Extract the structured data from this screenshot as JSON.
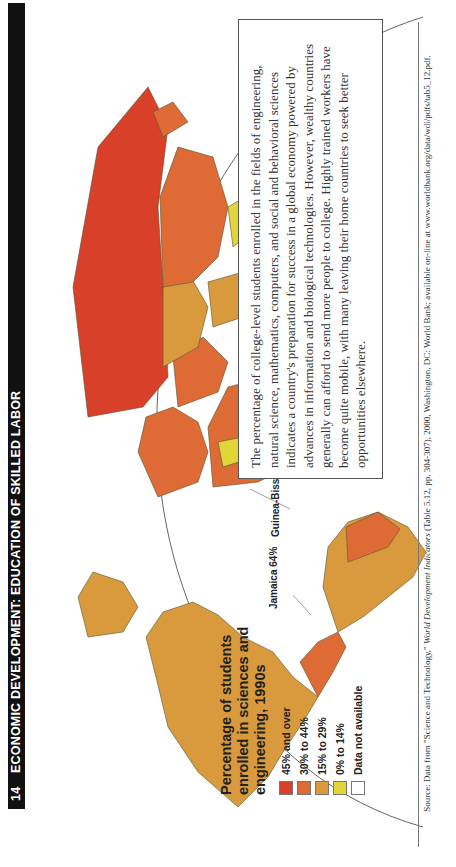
{
  "header": {
    "page_number": "14",
    "title": "ECONOMIC DEVELOPMENT: EDUCATION OF SKILLED LABOR"
  },
  "legend": {
    "title": "Percentage of students enrolled in sciences and engineering, 1990s",
    "items": [
      {
        "label": "45% and over",
        "color": "#d8402a"
      },
      {
        "label": "30% to 44%",
        "color": "#de6a36"
      },
      {
        "label": "15% to 29%",
        "color": "#d99a3e"
      },
      {
        "label": "0% to 14%",
        "color": "#e2d53a"
      },
      {
        "label": "Data not available",
        "color": "#ffffff"
      }
    ]
  },
  "callouts": {
    "jamaica": "Jamaica 64%",
    "guinea_bissau": "Guinea-Bissau 0%"
  },
  "textbox": {
    "text": "The percentage of college-level students enrolled in the fields of engineering, natural science, mathematics, computers, and social and behavioral sciences indicates a country's preparation for success in a global economy powered by advances in information and biological technologies. However, wealthy countries generally can afford to send more people to college. Highly trained workers have become quite mobile, with many leaving their home countries to seek better opportunities elsewhere."
  },
  "source": {
    "prefix": "Source: Data from \"Science and Technology,\" ",
    "publication": "World Development Indicators",
    "suffix": " (Table 5.12, pp. 304-307), 2000, Washington, DC: World Bank; available on-line at www.worldbank.org/data/wdi/pdfs/tab5_12.pdf."
  },
  "colors": {
    "level_45_plus": "#d8402a",
    "level_30_44": "#de6a36",
    "level_15_29": "#d99a3e",
    "level_0_14": "#e2d53a",
    "not_available": "#ffffff"
  }
}
